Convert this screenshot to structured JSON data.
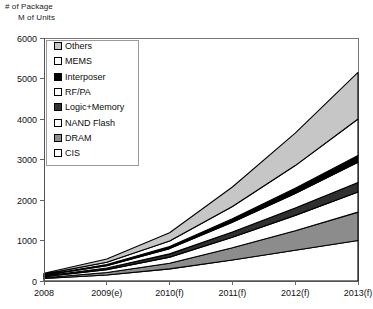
{
  "header": {
    "line1": "# of Package",
    "line2": "M of Units"
  },
  "chart_data": {
    "type": "area",
    "stacked": true,
    "title": "",
    "subtitle": "",
    "xlabel": "",
    "ylabel": "M of Units",
    "y_axis_header": "# of Package",
    "categories": [
      "2008",
      "2009(e)",
      "2010(f)",
      "2011(f)",
      "2012(f)",
      "2013(f)"
    ],
    "x": [
      2008,
      2009,
      2010,
      2011,
      2012,
      2013
    ],
    "xtick_labels": [
      "2008",
      "2009(e)",
      "2010(f)",
      "2011(f)",
      "2012(f)",
      "2013(f)"
    ],
    "ytick_labels": [
      "0",
      "1000",
      "2000",
      "3000",
      "4000",
      "5000",
      "6000"
    ],
    "yticks": [
      0,
      1000,
      2000,
      3000,
      4000,
      5000,
      6000
    ],
    "ylim": [
      0,
      6000
    ],
    "grid": false,
    "legend_position": "upper-left",
    "stack_order_bottom_to_top": [
      "CIS",
      "DRAM",
      "NAND Flash",
      "Logic+Memory",
      "RF/PA",
      "Interposer",
      "MEMS",
      "Others"
    ],
    "series": [
      {
        "name": "CIS",
        "color": "#ffffff",
        "swatch": "white",
        "values": [
          60,
          150,
          300,
          520,
          760,
          1000
        ]
      },
      {
        "name": "DRAM",
        "color": "#8c8c8c",
        "swatch": "gray",
        "values": [
          20,
          60,
          140,
          300,
          480,
          700
        ]
      },
      {
        "name": "NAND Flash",
        "color": "#ffffff",
        "swatch": "white",
        "values": [
          25,
          70,
          150,
          260,
          380,
          500
        ]
      },
      {
        "name": "Logic+Memory",
        "color": "#303030",
        "swatch": "dark-gray",
        "values": [
          15,
          40,
          80,
          130,
          180,
          230
        ]
      },
      {
        "name": "RF/PA",
        "color": "#ffffff",
        "swatch": "white",
        "values": [
          20,
          60,
          130,
          240,
          360,
          500
        ]
      },
      {
        "name": "Interposer",
        "color": "#000000",
        "swatch": "black",
        "values": [
          10,
          25,
          50,
          90,
          130,
          170
        ]
      },
      {
        "name": "MEMS",
        "color": "#ffffff",
        "swatch": "white",
        "values": [
          20,
          60,
          140,
          300,
          560,
          900
        ]
      },
      {
        "name": "Others",
        "color": "#c6c6c6",
        "swatch": "light-gray",
        "values": [
          20,
          80,
          200,
          480,
          800,
          1150
        ]
      }
    ],
    "totals": [
      190,
      545,
      1190,
      2320,
      3650,
      5150
    ]
  },
  "legend": {
    "items": [
      {
        "label": "Others",
        "swatch": "light-gray"
      },
      {
        "label": "MEMS",
        "swatch": "white"
      },
      {
        "label": "Interposer",
        "swatch": "black"
      },
      {
        "label": "RF/PA",
        "swatch": "white"
      },
      {
        "label": "Logic+Memory",
        "swatch": "dark-gray"
      },
      {
        "label": "NAND Flash",
        "swatch": "white"
      },
      {
        "label": "DRAM",
        "swatch": "gray"
      },
      {
        "label": "CIS",
        "swatch": "white"
      }
    ]
  },
  "colors": {
    "light-gray": "#c6c6c6",
    "gray": "#8c8c8c",
    "dark-gray": "#303030",
    "black": "#000000",
    "white": "#ffffff",
    "axis": "#555555",
    "frame": "#777777"
  }
}
